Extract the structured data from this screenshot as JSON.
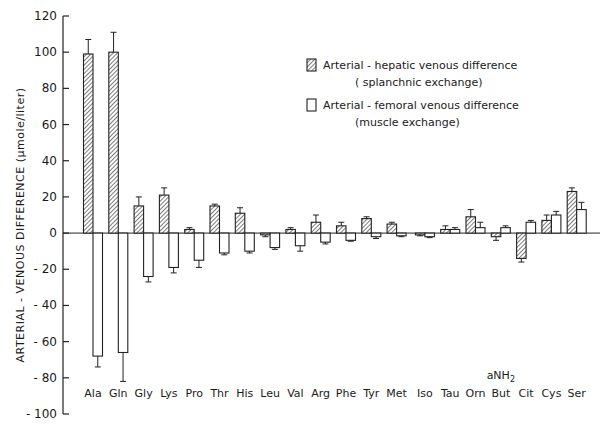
{
  "chart_data": {
    "type": "bar",
    "title": "",
    "xlabel": "",
    "ylabel": "ARTERIAL - VENOUS DIFFERENCE (µmole/liter)",
    "ylim": [
      -100,
      120
    ],
    "yticks": [
      120,
      100,
      80,
      60,
      40,
      20,
      0,
      -20,
      -40,
      -60,
      -80,
      -100
    ],
    "grid": false,
    "legend_position": "upper right",
    "categories": [
      "Ala",
      "Gln",
      "Gly",
      "Lys",
      "Pro",
      "Thr",
      "His",
      "Leu",
      "Val",
      "Arg",
      "Phe",
      "Tyr",
      "Met",
      "Iso",
      "Tau",
      "Orn",
      "aNH2 But",
      "Cit",
      "Cys",
      "Ser"
    ],
    "category_labels_display": [
      "Ala",
      "Gln",
      "Gly",
      "Lys",
      "Pro",
      "Thr",
      "His",
      "Leu",
      "Val",
      "Arg",
      "Phe",
      "Tyr",
      "Met",
      "Iso",
      "Tau",
      "Orn",
      "But",
      "Cit",
      "Cys",
      "Ser"
    ],
    "category_superlabel": {
      "index": 16,
      "text": "aNH",
      "subscript": "2"
    },
    "series": [
      {
        "name": "Arterial-hepatic venous difference (splanchnic exchange)",
        "pattern": "hatched",
        "values": [
          99,
          100,
          15,
          21,
          2,
          15,
          11,
          -1,
          2,
          6,
          4,
          8,
          5,
          -1,
          2,
          9,
          -2,
          -14,
          7,
          23
        ],
        "error_tops": [
          107,
          111,
          20,
          25,
          3,
          16,
          14,
          -2,
          3,
          10,
          6,
          9,
          6,
          -1.5,
          4,
          13,
          -4,
          -16,
          10,
          25
        ]
      },
      {
        "name": "Arterial-femoral venous difference (muscle exchange)",
        "pattern": "open",
        "values": [
          -68,
          -66,
          -24,
          -19,
          -15,
          -11,
          -10,
          -8,
          -7,
          -5,
          -4,
          -2,
          -1.5,
          -2,
          2,
          3,
          3,
          6,
          10,
          13
        ],
        "error_tops": [
          -74,
          -82,
          -27,
          -22,
          -19,
          -12,
          -11,
          -9,
          -10,
          -6,
          -4.5,
          -3,
          -2,
          -2.5,
          3,
          6,
          4,
          7,
          12,
          17
        ]
      }
    ]
  },
  "legend": {
    "items": [
      {
        "line1": "Arterial - hepatic venous difference",
        "line2": "( splanchnic exchange)",
        "pattern": "hatched"
      },
      {
        "line1": "Arterial - femoral venous difference",
        "line2": "(muscle exchange)",
        "pattern": "open"
      }
    ]
  },
  "axis": {
    "ylabel_main": "ARTERIAL - VENOUS DIFFERENCE",
    "ylabel_unit": "(µmole/liter)"
  }
}
